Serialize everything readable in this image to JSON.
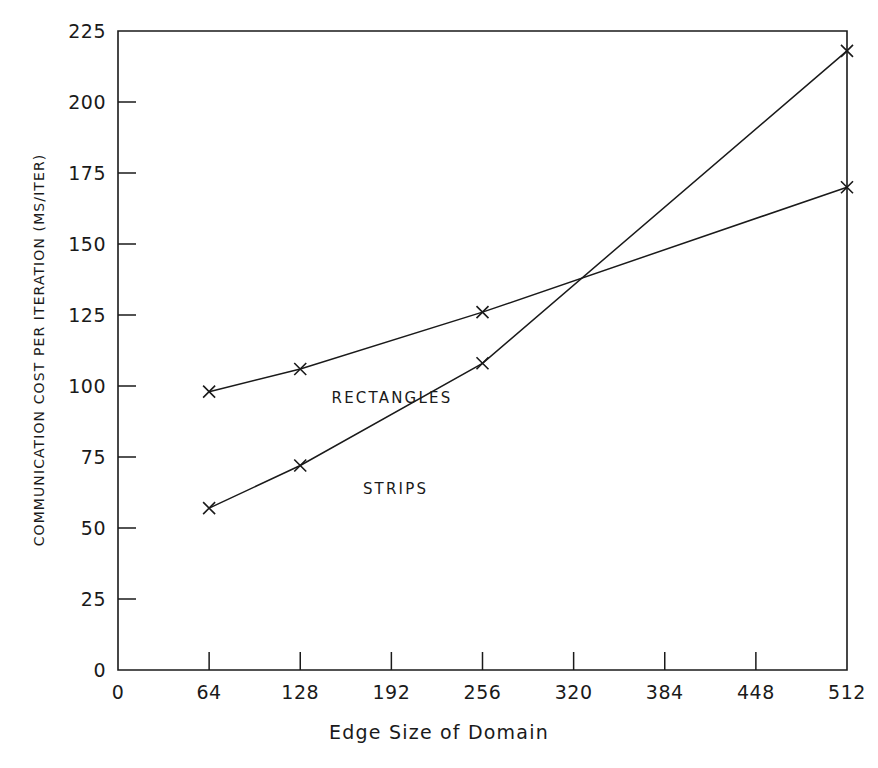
{
  "chart_data": {
    "type": "line",
    "title": "",
    "xlabel": "Edge Size of Domain",
    "ylabel": "COMMUNICATION COST PER ITERATION (MS/ITER)",
    "xlim": [
      0,
      512
    ],
    "ylim": [
      0,
      225
    ],
    "xticks": [
      0,
      64,
      128,
      192,
      256,
      320,
      384,
      448,
      512
    ],
    "xtick_labels": [
      "0",
      "64",
      "128",
      "192",
      "256",
      "320",
      "384",
      "448",
      "512"
    ],
    "yticks": [
      0,
      25,
      50,
      75,
      100,
      125,
      150,
      175,
      200,
      225
    ],
    "ytick_labels": [
      "0",
      "25",
      "50",
      "75",
      "100",
      "125",
      "150",
      "175",
      "200",
      "225"
    ],
    "grid": false,
    "legend_position": "inline-annotation",
    "marker": "x",
    "x": [
      64,
      128,
      256,
      512
    ],
    "series": [
      {
        "name": "RECTANGLES",
        "values": [
          98,
          106,
          126,
          170
        ],
        "label_x": 150,
        "label_y": 94
      },
      {
        "name": "STRIPS",
        "values": [
          57,
          72,
          108,
          218
        ],
        "label_x": 172,
        "label_y": 62
      }
    ]
  },
  "axes": {
    "x_title": "Edge Size of Domain",
    "y_title": "COMMUNICATION COST PER ITERATION (MS/ITER)"
  }
}
